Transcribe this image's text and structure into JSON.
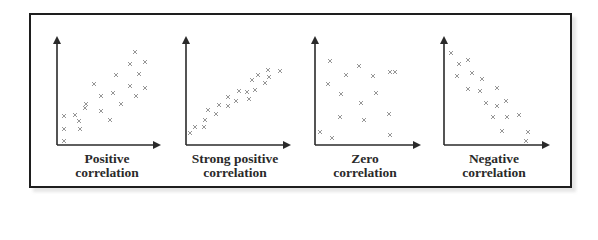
{
  "figure": {
    "panels": [
      {
        "id": "positive",
        "label_line1": "Positive",
        "label_line2": "correlation"
      },
      {
        "id": "strong-positive",
        "label_line1": "Strong positive",
        "label_line2": "correlation"
      },
      {
        "id": "zero",
        "label_line1": "Zero",
        "label_line2": "correlation"
      },
      {
        "id": "negative",
        "label_line1": "Negative",
        "label_line2": "correlation"
      }
    ],
    "marker": "x",
    "colors": {
      "axis": "#2a2a2a",
      "marker": "#8a8a8a",
      "border": "#1e1e1e",
      "text": "#2a2a2a"
    }
  },
  "chart_data": [
    {
      "type": "scatter",
      "title": "Positive correlation",
      "xlabel": "",
      "ylabel": "",
      "axes_ticks": false,
      "points_px": [
        [
          64,
          141
        ],
        [
          64,
          129
        ],
        [
          80,
          129
        ],
        [
          64,
          116
        ],
        [
          75,
          115
        ],
        [
          85,
          108
        ],
        [
          79,
          121
        ],
        [
          86,
          104
        ],
        [
          101,
          111
        ],
        [
          94,
          84
        ],
        [
          101,
          96
        ],
        [
          110,
          120
        ],
        [
          113,
          93
        ],
        [
          121,
          104
        ],
        [
          116,
          75
        ],
        [
          130,
          86
        ],
        [
          136,
          96
        ],
        [
          130,
          64
        ],
        [
          135,
          52
        ],
        [
          139,
          74
        ],
        [
          145,
          62
        ],
        [
          145,
          88
        ]
      ]
    },
    {
      "type": "scatter",
      "title": "Strong positive correlation",
      "xlabel": "",
      "ylabel": "",
      "axes_ticks": false,
      "points_px": [
        [
          190,
          133
        ],
        [
          195,
          127
        ],
        [
          204,
          127
        ],
        [
          205,
          120
        ],
        [
          208,
          110
        ],
        [
          216,
          114
        ],
        [
          219,
          105
        ],
        [
          228,
          97
        ],
        [
          228,
          106
        ],
        [
          236,
          101
        ],
        [
          239,
          91
        ],
        [
          247,
          92
        ],
        [
          249,
          99
        ],
        [
          252,
          80
        ],
        [
          255,
          90
        ],
        [
          258,
          75
        ],
        [
          265,
          83
        ],
        [
          268,
          70
        ],
        [
          269,
          77
        ],
        [
          280,
          71
        ]
      ]
    },
    {
      "type": "scatter",
      "title": "Zero correlation",
      "xlabel": "",
      "ylabel": "",
      "axes_ticks": false,
      "points_px": [
        [
          320,
          132
        ],
        [
          332,
          138
        ],
        [
          330,
          61
        ],
        [
          328,
          84
        ],
        [
          341,
          94
        ],
        [
          340,
          117
        ],
        [
          346,
          75
        ],
        [
          359,
          66
        ],
        [
          361,
          103
        ],
        [
          364,
          120
        ],
        [
          373,
          76
        ],
        [
          376,
          93
        ],
        [
          389,
          114
        ],
        [
          390,
          72
        ],
        [
          390,
          135
        ],
        [
          395,
          72
        ]
      ]
    },
    {
      "type": "scatter",
      "title": "Negative correlation",
      "xlabel": "",
      "ylabel": "",
      "axes_ticks": false,
      "points_px": [
        [
          451,
          53
        ],
        [
          459,
          64
        ],
        [
          468,
          60
        ],
        [
          457,
          76
        ],
        [
          472,
          73
        ],
        [
          482,
          79
        ],
        [
          468,
          89
        ],
        [
          480,
          91
        ],
        [
          486,
          103
        ],
        [
          497,
          88
        ],
        [
          497,
          106
        ],
        [
          506,
          101
        ],
        [
          493,
          117
        ],
        [
          507,
          117
        ],
        [
          519,
          115
        ],
        [
          502,
          131
        ],
        [
          528,
          132
        ],
        [
          526,
          141
        ]
      ]
    }
  ]
}
